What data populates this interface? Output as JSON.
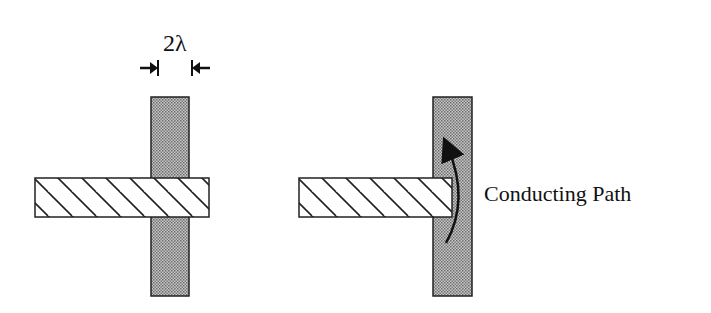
{
  "diagram": {
    "dimension_label": "2λ",
    "path_label": "Conducting Path",
    "left_figure": {
      "description": "Hatched (poly/diffusion) bar crossing fully over a stippled vertical bar",
      "vertical_bar": {
        "x": 151,
        "y": 97,
        "w": 38,
        "h": 199,
        "fill": "stipple-gray"
      },
      "horizontal_bar": {
        "x": 35,
        "y": 178,
        "w": 174,
        "h": 39,
        "fill": "diagonal-hatch"
      },
      "overhang_dimension": "2λ"
    },
    "right_figure": {
      "description": "Hatched bar ending inside the stippled vertical bar; curved arrow shows conducting path around its end",
      "vertical_bar": {
        "x": 433,
        "y": 97,
        "w": 39,
        "h": 199,
        "fill": "stipple-gray"
      },
      "horizontal_bar": {
        "x": 299,
        "y": 178,
        "w": 153,
        "h": 39,
        "fill": "diagonal-hatch"
      },
      "arrow": "curved arrow pointing upward along vertical bar"
    },
    "colors": {
      "stroke": "#222222",
      "stipple": "#9a9a9a",
      "background": "#ffffff"
    }
  }
}
